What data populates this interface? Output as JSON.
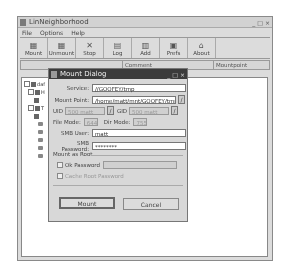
{
  "window": {
    "title": "LinNeighborhood",
    "controls": [
      "_",
      "□",
      "×"
    ]
  },
  "menu": [
    "File",
    "Options",
    "Help"
  ],
  "toolbar": [
    {
      "label": "Mount",
      "icon": "mount-icon",
      "glyph": "▦"
    },
    {
      "label": "Unmount",
      "icon": "unmount-icon",
      "glyph": "▦"
    },
    {
      "label": "Stop",
      "icon": "stop-icon",
      "glyph": "✕"
    },
    {
      "label": "Log",
      "icon": "log-icon",
      "glyph": "▤"
    },
    {
      "label": "Add",
      "icon": "add-icon",
      "glyph": "▥"
    },
    {
      "label": "Prefs",
      "icon": "prefs-icon",
      "glyph": "▣"
    },
    {
      "label": "About",
      "icon": "about-icon",
      "glyph": "⌂"
    }
  ],
  "columns": [
    "",
    "Comment",
    "Mountpoint"
  ],
  "tree": {
    "root_label": "daf",
    "nodes": [
      "H",
      "",
      "T",
      "",
      "",
      "",
      "",
      "",
      "",
      ""
    ]
  },
  "dialog": {
    "title": "Mount Dialog",
    "controls": [
      "_",
      "□",
      "×"
    ],
    "service_label": "Service:",
    "service_value": "//GOOFEY/tmp",
    "mountpoint_label": "Mount Point:",
    "mountpoint_value": "/home/matt/mnt/GOOFEY/tmp/",
    "uid_label": "UID",
    "uid_value": "500 matt",
    "gid_label": "GID",
    "gid_value": "500 matt",
    "filemode_label": "File Mode:",
    "filemode_value": "644",
    "dirmode_label": "Dir Mode:",
    "dirmode_value": "755",
    "smbuser_label": "SMB User:",
    "smbuser_value": "matt",
    "smbpass_label": "SMB Password:",
    "smbpass_value": "********",
    "mount_as_root_label": "Mount as Root",
    "root_password_label": "Ok  Password",
    "cache_root_label": "Cache Root Password",
    "mount_button": "Mount",
    "cancel_button": "Cancel"
  }
}
